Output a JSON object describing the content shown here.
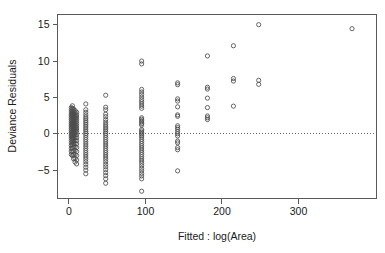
{
  "chart_data": {
    "type": "scatter",
    "title": "",
    "xlabel": "Fitted : log(Area)",
    "ylabel": "Deviance Residuals",
    "xlim": [
      -15,
      402
    ],
    "ylim": [
      -8.9,
      16.4
    ],
    "xticks": [
      0,
      100,
      200,
      300
    ],
    "xtick_labels": [
      "0",
      "100",
      "200",
      "300"
    ],
    "yticks": [
      -5,
      0,
      5,
      10,
      15
    ],
    "ytick_labels": [
      "-5",
      "0",
      "5",
      "10",
      "15"
    ],
    "grid": false,
    "legend": null,
    "reference_lines": [
      {
        "orientation": "horizontal",
        "y": 0,
        "style": "dotted"
      }
    ],
    "marker": {
      "shape": "circle-open",
      "radius": 2.1,
      "color": "#4d4d4d"
    },
    "series": [
      {
        "name": "Deviance residuals vs fitted",
        "points": [
          [
            3,
            3.6
          ],
          [
            3,
            3.3
          ],
          [
            3,
            3.0
          ],
          [
            3,
            2.7
          ],
          [
            3,
            2.45
          ],
          [
            3,
            2.2
          ],
          [
            3,
            1.95
          ],
          [
            3,
            1.7
          ],
          [
            3,
            1.45
          ],
          [
            3,
            1.2
          ],
          [
            3,
            0.95
          ],
          [
            3,
            0.7
          ],
          [
            3,
            0.45
          ],
          [
            3,
            0.2
          ],
          [
            3,
            -0.05
          ],
          [
            3,
            -0.3
          ],
          [
            3,
            -0.6
          ],
          [
            3,
            -0.9
          ],
          [
            3,
            -1.25
          ],
          [
            3,
            -1.6
          ],
          [
            3,
            -2.0
          ],
          [
            3,
            -2.4
          ],
          [
            3,
            -2.85
          ],
          [
            4.5,
            3.85
          ],
          [
            4.5,
            3.5
          ],
          [
            4.5,
            3.15
          ],
          [
            4.5,
            2.85
          ],
          [
            4.5,
            2.6
          ],
          [
            4.5,
            2.35
          ],
          [
            4.5,
            2.1
          ],
          [
            4.5,
            1.85
          ],
          [
            4.5,
            1.6
          ],
          [
            4.5,
            1.35
          ],
          [
            4.5,
            1.1
          ],
          [
            4.5,
            0.85
          ],
          [
            4.5,
            0.6
          ],
          [
            4.5,
            0.35
          ],
          [
            4.5,
            0.1
          ],
          [
            4.5,
            -0.15
          ],
          [
            4.5,
            -0.45
          ],
          [
            4.5,
            -0.75
          ],
          [
            4.5,
            -1.1
          ],
          [
            4.5,
            -1.5
          ],
          [
            4.5,
            -1.95
          ],
          [
            4.5,
            -2.45
          ],
          [
            4.5,
            -3.0
          ],
          [
            6,
            3.4
          ],
          [
            6,
            3.05
          ],
          [
            6,
            2.75
          ],
          [
            6,
            2.5
          ],
          [
            6,
            2.25
          ],
          [
            6,
            2.0
          ],
          [
            6,
            1.75
          ],
          [
            6,
            1.5
          ],
          [
            6,
            1.25
          ],
          [
            6,
            1.0
          ],
          [
            6,
            0.75
          ],
          [
            6,
            0.5
          ],
          [
            6,
            0.25
          ],
          [
            6,
            0.0
          ],
          [
            6,
            -0.3
          ],
          [
            6,
            -0.65
          ],
          [
            6,
            -1.0
          ],
          [
            6,
            -1.4
          ],
          [
            6,
            -1.85
          ],
          [
            6,
            -2.35
          ],
          [
            6,
            -2.9
          ],
          [
            6,
            -3.45
          ],
          [
            8,
            3.2
          ],
          [
            8,
            2.9
          ],
          [
            8,
            2.6
          ],
          [
            8,
            2.35
          ],
          [
            8,
            2.1
          ],
          [
            8,
            1.85
          ],
          [
            8,
            1.6
          ],
          [
            8,
            1.35
          ],
          [
            8,
            1.1
          ],
          [
            8,
            0.85
          ],
          [
            8,
            0.6
          ],
          [
            8,
            0.35
          ],
          [
            8,
            0.1
          ],
          [
            8,
            -0.2
          ],
          [
            8,
            -0.55
          ],
          [
            8,
            -0.95
          ],
          [
            8,
            -1.35
          ],
          [
            8,
            -1.8
          ],
          [
            8,
            -2.3
          ],
          [
            8,
            -2.85
          ],
          [
            8,
            -3.4
          ],
          [
            8,
            -3.9
          ],
          [
            10,
            2.95
          ],
          [
            10,
            2.6
          ],
          [
            10,
            2.3
          ],
          [
            10,
            2.0
          ],
          [
            10,
            1.7
          ],
          [
            10,
            1.4
          ],
          [
            10,
            1.1
          ],
          [
            10,
            0.8
          ],
          [
            10,
            0.5
          ],
          [
            10,
            0.2
          ],
          [
            10,
            -0.15
          ],
          [
            10,
            -0.55
          ],
          [
            10,
            -0.95
          ],
          [
            10,
            -1.4
          ],
          [
            10,
            -1.9
          ],
          [
            10,
            -2.45
          ],
          [
            10,
            -3.0
          ],
          [
            10,
            -3.6
          ],
          [
            10,
            -4.15
          ],
          [
            22,
            4.1
          ],
          [
            22,
            3.3
          ],
          [
            22,
            2.95
          ],
          [
            22,
            2.6
          ],
          [
            22,
            2.3
          ],
          [
            22,
            2.05
          ],
          [
            22,
            1.8
          ],
          [
            22,
            1.55
          ],
          [
            22,
            1.3
          ],
          [
            22,
            1.05
          ],
          [
            22,
            0.8
          ],
          [
            22,
            0.55
          ],
          [
            22,
            0.3
          ],
          [
            22,
            0.05
          ],
          [
            22,
            -0.2
          ],
          [
            22,
            -0.5
          ],
          [
            22,
            -0.8
          ],
          [
            22,
            -1.1
          ],
          [
            22,
            -1.4
          ],
          [
            22,
            -1.7
          ],
          [
            22,
            -2.0
          ],
          [
            22,
            -2.3
          ],
          [
            22,
            -2.6
          ],
          [
            22,
            -2.9
          ],
          [
            22,
            -3.2
          ],
          [
            22,
            -3.5
          ],
          [
            22,
            -3.85
          ],
          [
            22,
            -4.2
          ],
          [
            22,
            -4.6
          ],
          [
            22,
            -5.0
          ],
          [
            22,
            -5.5
          ],
          [
            48,
            5.3
          ],
          [
            48,
            3.65
          ],
          [
            48,
            3.3
          ],
          [
            48,
            2.7
          ],
          [
            48,
            2.35
          ],
          [
            48,
            1.95
          ],
          [
            48,
            1.6
          ],
          [
            48,
            1.3
          ],
          [
            48,
            1.05
          ],
          [
            48,
            0.8
          ],
          [
            48,
            0.55
          ],
          [
            48,
            0.3
          ],
          [
            48,
            0.05
          ],
          [
            48,
            -0.2
          ],
          [
            48,
            -0.5
          ],
          [
            48,
            -0.8
          ],
          [
            48,
            -1.1
          ],
          [
            48,
            -1.4
          ],
          [
            48,
            -1.7
          ],
          [
            48,
            -2.0
          ],
          [
            48,
            -2.3
          ],
          [
            48,
            -2.6
          ],
          [
            48,
            -2.9
          ],
          [
            48,
            -3.2
          ],
          [
            48,
            -3.5
          ],
          [
            48,
            -3.85
          ],
          [
            48,
            -4.2
          ],
          [
            48,
            -4.55
          ],
          [
            48,
            -4.95
          ],
          [
            48,
            -5.35
          ],
          [
            48,
            -5.75
          ],
          [
            48,
            -6.2
          ],
          [
            48,
            -6.8
          ],
          [
            95,
            10.0
          ],
          [
            95,
            9.6
          ],
          [
            95,
            6.1
          ],
          [
            95,
            5.75
          ],
          [
            95,
            5.4
          ],
          [
            95,
            5.05
          ],
          [
            95,
            4.7
          ],
          [
            95,
            4.4
          ],
          [
            95,
            4.1
          ],
          [
            95,
            3.8
          ],
          [
            95,
            3.5
          ],
          [
            95,
            2.2
          ],
          [
            95,
            2.0
          ],
          [
            95,
            1.8
          ],
          [
            95,
            1.6
          ],
          [
            95,
            1.4
          ],
          [
            95,
            1.2
          ],
          [
            95,
            0.6
          ],
          [
            95,
            0.4
          ],
          [
            95,
            0.2
          ],
          [
            95,
            0.0
          ],
          [
            95,
            -0.2
          ],
          [
            95,
            -0.45
          ],
          [
            95,
            -0.75
          ],
          [
            95,
            -1.05
          ],
          [
            95,
            -1.35
          ],
          [
            95,
            -1.65
          ],
          [
            95,
            -1.95
          ],
          [
            95,
            -2.25
          ],
          [
            95,
            -2.55
          ],
          [
            95,
            -2.85
          ],
          [
            95,
            -3.15
          ],
          [
            95,
            -3.45
          ],
          [
            95,
            -3.75
          ],
          [
            95,
            -4.05
          ],
          [
            95,
            -4.4
          ],
          [
            95,
            -4.75
          ],
          [
            95,
            -5.1
          ],
          [
            95,
            -5.45
          ],
          [
            95,
            -5.8
          ],
          [
            95,
            -6.2
          ],
          [
            95,
            -7.9
          ],
          [
            142,
            7.0
          ],
          [
            142,
            6.75
          ],
          [
            142,
            4.8
          ],
          [
            142,
            4.5
          ],
          [
            142,
            3.7
          ],
          [
            142,
            2.6
          ],
          [
            142,
            2.4
          ],
          [
            142,
            1.1
          ],
          [
            142,
            0.85
          ],
          [
            142,
            0.6
          ],
          [
            142,
            0.3
          ],
          [
            142,
            0.0
          ],
          [
            142,
            -0.3
          ],
          [
            142,
            -1.0
          ],
          [
            142,
            -1.25
          ],
          [
            142,
            -1.9
          ],
          [
            142,
            -2.2
          ],
          [
            142,
            -5.1
          ],
          [
            181,
            10.7
          ],
          [
            181,
            6.4
          ],
          [
            181,
            6.15
          ],
          [
            181,
            4.9
          ],
          [
            181,
            3.6
          ],
          [
            181,
            2.45
          ],
          [
            181,
            2.2
          ],
          [
            181,
            1.95
          ],
          [
            215,
            12.1
          ],
          [
            215,
            7.6
          ],
          [
            215,
            7.25
          ],
          [
            215,
            3.8
          ],
          [
            248,
            15.0
          ],
          [
            248,
            7.35
          ],
          [
            248,
            6.8
          ],
          [
            370,
            14.45
          ]
        ]
      }
    ]
  },
  "axes": {
    "x_title": "Fitted : log(Area)",
    "y_title": "Deviance Residuals"
  }
}
